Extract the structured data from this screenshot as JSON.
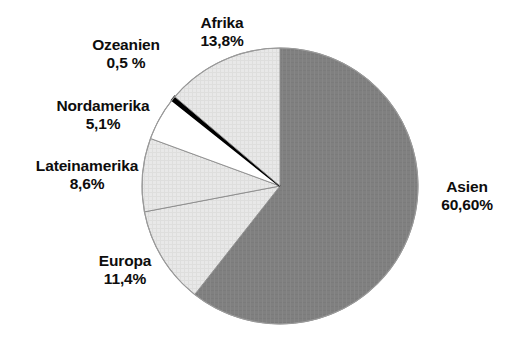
{
  "chart_data": {
    "type": "pie",
    "title": "",
    "subtitle": "",
    "xlabel": "",
    "ylabel": "",
    "legend_position": "none",
    "grid": false,
    "start_angle_deg": 0,
    "direction": "clockwise",
    "categories": [
      "Asien",
      "Europa",
      "Lateinamerika",
      "Nordamerika",
      "Ozeanien",
      "Afrika"
    ],
    "values": [
      60.6,
      11.4,
      8.6,
      5.1,
      0.5,
      13.8
    ],
    "value_labels": [
      "60,60%",
      "11,4%",
      "8,6%",
      "5,1%",
      "0,5 %",
      "13,8%"
    ],
    "colors": [
      "#808080",
      "#e6e6e6",
      "#e6e6e6",
      "#ffffff",
      "#000000",
      "#e3e3e3"
    ],
    "slices": [
      {
        "name": "Asien",
        "value": 60.6,
        "value_label": "60,60%",
        "color": "#808080",
        "start_deg": 0,
        "end_deg": 218.16,
        "label_side": "right"
      },
      {
        "name": "Europa",
        "value": 11.4,
        "value_label": "11,4%",
        "color": "#e6e6e6",
        "start_deg": 218.16,
        "end_deg": 259.2,
        "label_side": "left"
      },
      {
        "name": "Lateinamerika",
        "value": 8.6,
        "value_label": "8,6%",
        "color": "#e6e6e6",
        "start_deg": 259.2,
        "end_deg": 290.16,
        "label_side": "left"
      },
      {
        "name": "Nordamerika",
        "value": 5.1,
        "value_label": "5,1%",
        "color": "#ffffff",
        "start_deg": 290.16,
        "end_deg": 308.52,
        "label_side": "left"
      },
      {
        "name": "Ozeanien",
        "value": 0.5,
        "value_label": "0,5 %",
        "color": "#000000",
        "start_deg": 308.52,
        "end_deg": 310.32,
        "label_side": "left"
      },
      {
        "name": "Afrika",
        "value": 13.8,
        "value_label": "13,8%",
        "color": "#e3e3e3",
        "start_deg": 310.32,
        "end_deg": 360,
        "label_side": "top"
      }
    ]
  },
  "labels": {
    "afrika": {
      "name": "Afrika",
      "value": "13,8%"
    },
    "ozeanien": {
      "name": "Ozeanien",
      "value": "0,5 %"
    },
    "nordamerika": {
      "name": "Nordamerika",
      "value": "5,1%"
    },
    "lateinamerika": {
      "name": "Lateinamerika",
      "value": "8,6%"
    },
    "europa": {
      "name": "Europa",
      "value": "11,4%"
    },
    "asien": {
      "name": "Asien",
      "value": "60,60%"
    }
  },
  "style": {
    "background": "#ffffff",
    "text_color": "#0d0d0d",
    "slice_outline": "#8a8a8a",
    "asien_fill": "#808080",
    "afrika_fill": "#e3e3e3",
    "europa_fill": "#e6e6e6",
    "lateinamerika_fill": "#e6e6e6",
    "nordamerika_fill": "#ffffff",
    "ozeanien_fill": "#000000"
  },
  "geometry": {
    "center_x": 280,
    "center_y": 186,
    "radius": 138
  }
}
